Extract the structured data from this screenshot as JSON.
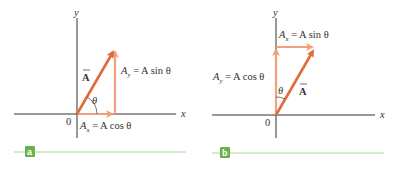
{
  "colors": {
    "axis": "#333333",
    "vector": "#e06a3a",
    "component": "#f0a07a",
    "badge": "#6ab04c",
    "rule": "#a9d49a",
    "text": "#333333"
  },
  "panel_a": {
    "badge": "a",
    "axis_x": "x",
    "axis_y": "y",
    "origin": "0",
    "vector_label": "A",
    "angle_label": "θ",
    "ay_label": "A",
    "ay_sub": "y",
    "ay_eq": " = A sin θ",
    "ax_label": "A",
    "ax_sub": "x",
    "ax_eq": " = A cos θ"
  },
  "panel_b": {
    "badge": "b",
    "axis_x": "x",
    "axis_y": "y",
    "origin": "0",
    "vector_label": "A",
    "angle_label": "θ",
    "ax_label": "A",
    "ax_sub": "x",
    "ax_eq": " = A sin θ",
    "ay_label": "A",
    "ay_sub": "y",
    "ay_eq": " = A cos θ"
  }
}
